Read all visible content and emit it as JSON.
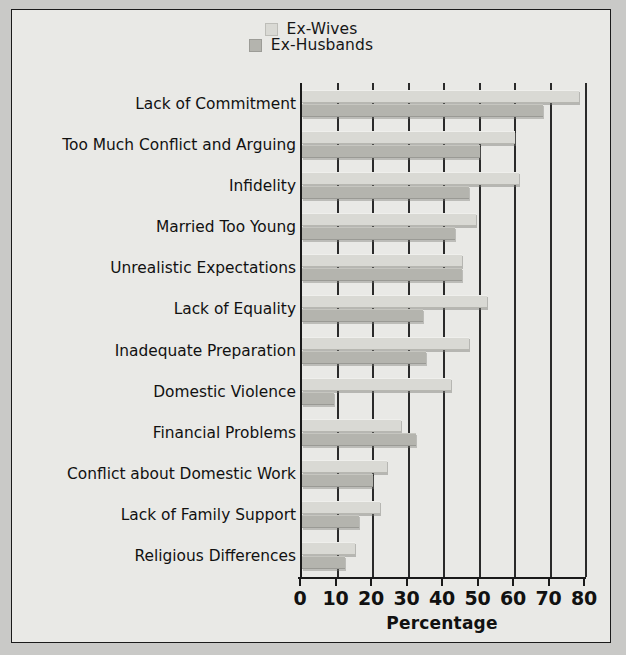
{
  "chart_data": {
    "type": "bar",
    "orientation": "horizontal",
    "title": "",
    "xlabel": "Percentage",
    "ylabel": "",
    "xlim": [
      0,
      80
    ],
    "xticks": [
      0,
      10,
      20,
      30,
      40,
      50,
      60,
      70,
      80
    ],
    "grid": true,
    "legend_position": "top-center",
    "categories": [
      "Lack of Commitment",
      "Too Much Conflict and Arguing",
      "Infidelity",
      "Married Too Young",
      "Unrealistic Expectations",
      "Lack of Equality",
      "Inadequate Preparation",
      "Domestic Violence",
      "Financial Problems",
      "Conflict about Domestic Work",
      "Lack of Family Support",
      "Religious Differences"
    ],
    "series": [
      {
        "name": "Ex-Wives",
        "color": "#d9d9d4",
        "values": [
          78,
          60,
          61,
          49,
          45,
          52,
          47,
          42,
          28,
          24,
          22,
          15
        ]
      },
      {
        "name": "Ex-Husbands",
        "color": "#b4b4ae",
        "values": [
          68,
          50,
          47,
          43,
          45,
          34,
          35,
          9,
          32,
          20,
          16,
          12
        ]
      }
    ]
  },
  "legend": {
    "items": [
      {
        "label": "Ex-Wives",
        "color": "#d9d9d4"
      },
      {
        "label": "Ex-Husbands",
        "color": "#b4b4ae"
      }
    ]
  },
  "axis": {
    "x_title": "Percentage",
    "tick_labels": [
      "0",
      "10",
      "20",
      "30",
      "40",
      "50",
      "60",
      "70",
      "80"
    ]
  },
  "colors": {
    "page_background": "#c9c9c7",
    "figure_background": "#e9e9e6",
    "frame": "#1a1a1a",
    "gridline": "#2a2a2a",
    "text": "#111111"
  }
}
